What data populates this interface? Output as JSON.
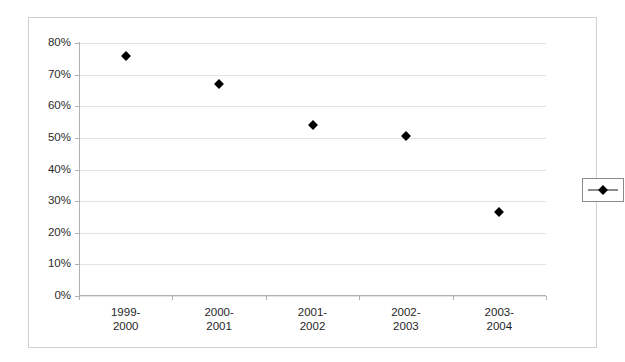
{
  "chart_data": {
    "type": "scatter",
    "title": "",
    "subtitle": "",
    "xlabel": "",
    "ylabel": "",
    "categories": [
      "1999-\n2000",
      "2000-\n2001",
      "2001-\n2002",
      "2002-\n2003",
      "2003-\n2004"
    ],
    "category_lines": [
      [
        "1999-",
        "2000"
      ],
      [
        "2000-",
        "2001"
      ],
      [
        "2001-",
        "2002"
      ],
      [
        "2002-",
        "2003"
      ],
      [
        "2003-",
        "2004"
      ]
    ],
    "series": [
      {
        "name": "",
        "marker": "diamond",
        "color": "#000000",
        "values": [
          76,
          67,
          54,
          50.5,
          26.5
        ]
      }
    ],
    "ylim": [
      0,
      80
    ],
    "ytick_values": [
      0,
      10,
      20,
      30,
      40,
      50,
      60,
      70,
      80
    ],
    "ytick_labels": [
      "0%",
      "10%",
      "20%",
      "30%",
      "40%",
      "50%",
      "60%",
      "70%",
      "80%"
    ],
    "grid": true,
    "grid_axis": "y",
    "grid_color": "#e3e3e3",
    "legend": {
      "position": "right",
      "entries": [
        {
          "label": "",
          "marker": "diamond",
          "color": "#000000"
        }
      ]
    },
    "axis_color": "#b0b0b0",
    "frame_color": "#cfcfcf",
    "background": "#ffffff"
  }
}
